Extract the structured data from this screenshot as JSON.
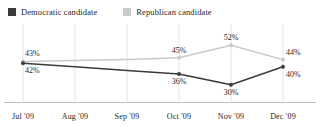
{
  "legend": {
    "items": [
      {
        "label": "Democratic candidate",
        "color": "#3b3b3b",
        "key": "democratic"
      },
      {
        "label": "Republican candidate",
        "color": "#c9c9c9",
        "key": "republican"
      }
    ]
  },
  "chart_data": {
    "type": "line",
    "title": "",
    "subtitle": "",
    "xlabel": "",
    "ylabel": "",
    "grid": "vertical",
    "legend_position": "top-left",
    "ylim": [
      26,
      56
    ],
    "categories": [
      "Jul '09",
      "Aug '09",
      "Sep '09",
      "Oct '09",
      "Nov '09",
      "Dec '09"
    ],
    "series": [
      {
        "name": "Democratic candidate",
        "color": "#3b3b3b",
        "values": [
          42,
          40,
          38,
          36,
          30,
          40
        ],
        "point_labels": [
          "42%",
          "",
          "",
          "36%",
          "30%",
          "40%"
        ]
      },
      {
        "name": "Republican candidate",
        "color": "#c9c9c9",
        "values": [
          43,
          43.5,
          44,
          45,
          52,
          44
        ],
        "point_labels": [
          "43%",
          "",
          "",
          "45%",
          "52%",
          "44%"
        ]
      }
    ]
  },
  "axis": {
    "ticks": [
      "Jul '09",
      "Aug '09",
      "Sep '09",
      "Oct '09",
      "Nov '09",
      "Dec '09"
    ]
  }
}
